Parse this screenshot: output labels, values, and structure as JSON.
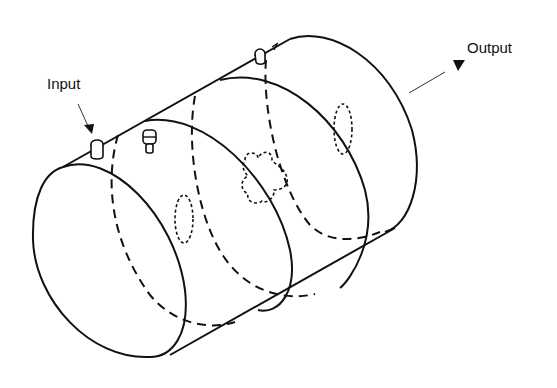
{
  "diagram": {
    "title": "",
    "labels": {
      "input": "Input",
      "output": "Output"
    },
    "components": [
      {
        "id": "cylinder-body",
        "type": "cylinder",
        "style": "solid"
      },
      {
        "id": "partition-1",
        "type": "ellipse",
        "style": "dashed"
      },
      {
        "id": "partition-2",
        "type": "ellipse",
        "style": "dashed"
      },
      {
        "id": "partition-3",
        "type": "ellipse",
        "style": "dashed"
      },
      {
        "id": "iris-slot-1",
        "type": "slot",
        "style": "dotted"
      },
      {
        "id": "iris-cross",
        "type": "cross-aperture",
        "style": "dotted"
      },
      {
        "id": "iris-slot-2",
        "type": "slot",
        "style": "dotted"
      },
      {
        "id": "input-port",
        "type": "probe"
      },
      {
        "id": "tuning-screw",
        "type": "probe"
      },
      {
        "id": "output-port",
        "type": "probe"
      }
    ],
    "colors": {
      "stroke": "#111111",
      "background": "#ffffff"
    }
  }
}
